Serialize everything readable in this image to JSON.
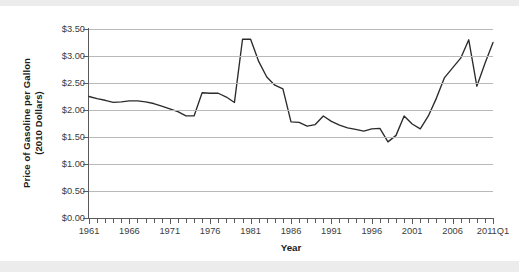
{
  "chart_data": {
    "type": "line",
    "title": "",
    "xlabel": "Year",
    "ylabel": "Price of Gasoline per Gallon (2010 Dollars)",
    "ylabel_line1": "Price of Gasoline per Gallon",
    "ylabel_line2": "(2010 Dollars)",
    "ylim": [
      0.0,
      3.5
    ],
    "ytick_values": [
      0.0,
      0.5,
      1.0,
      1.5,
      2.0,
      2.5,
      3.0,
      3.5
    ],
    "ytick_labels": [
      "$0.00",
      "$0.50",
      "$1.00",
      "$1.50",
      "$2.00",
      "$2.50",
      "$3.00",
      "$3.50"
    ],
    "xtick_labels": [
      "1961",
      "1966",
      "1971",
      "1976",
      "1981",
      "1986",
      "1991",
      "1996",
      "2001",
      "2006",
      "2011Q1"
    ],
    "xtick_years": [
      1961,
      1966,
      1971,
      1976,
      1981,
      1986,
      1991,
      1996,
      2001,
      2006,
      2011
    ],
    "xlim": [
      1961,
      2011
    ],
    "grid": "horizontal",
    "legend": "none",
    "line_color": "#2b2b2b",
    "grid_color": "#b9b9b9",
    "axis_color": "#5a5a5a",
    "x": [
      1961,
      1962,
      1963,
      1964,
      1965,
      1966,
      1967,
      1968,
      1969,
      1970,
      1971,
      1972,
      1973,
      1974,
      1975,
      1976,
      1977,
      1978,
      1979,
      1980,
      1981,
      1982,
      1983,
      1984,
      1985,
      1986,
      1987,
      1988,
      1989,
      1990,
      1991,
      1992,
      1993,
      1994,
      1995,
      1996,
      1997,
      1998,
      1999,
      2000,
      2001,
      2002,
      2003,
      2004,
      2005,
      2006,
      2007,
      2008,
      2009,
      2010,
      2011
    ],
    "values": [
      2.25,
      2.21,
      2.18,
      2.14,
      2.15,
      2.17,
      2.17,
      2.15,
      2.12,
      2.07,
      2.02,
      1.97,
      1.89,
      1.89,
      2.32,
      2.31,
      2.31,
      2.24,
      2.14,
      3.31,
      3.31,
      2.9,
      2.61,
      2.46,
      2.39,
      1.78,
      1.77,
      1.7,
      1.73,
      1.89,
      1.79,
      1.72,
      1.67,
      1.64,
      1.61,
      1.65,
      1.66,
      1.41,
      1.53,
      1.89,
      1.74,
      1.65,
      1.89,
      2.22,
      2.6,
      2.78,
      2.96,
      3.3,
      2.44,
      2.86,
      3.25
    ],
    "series_name": "Price of gasoline per gallon (2010 dollars)",
    "annotations": []
  },
  "figure": {
    "xaxis_title": "Year"
  }
}
